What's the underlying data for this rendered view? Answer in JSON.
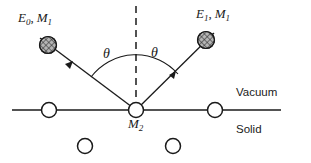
{
  "figure": {
    "kind": "scattering-diagram",
    "colors": {
      "ink": "#1a1a1a",
      "background": "#ffffff",
      "particle_fill": "#8c8c8c"
    }
  },
  "labels": {
    "incident": {
      "energy_symbol": "E",
      "energy_subscript": "0",
      "separator": ",",
      "mass_symbol": "M",
      "mass_subscript": "1",
      "full_text": "E0, M1"
    },
    "scattered": {
      "energy_symbol": "E",
      "energy_subscript": "1",
      "separator": ",",
      "mass_symbol": "M",
      "mass_subscript": "1",
      "full_text": "E1, M1"
    },
    "target": {
      "mass_symbol": "M",
      "mass_subscript": "2",
      "full_text": "M2"
    },
    "angle_left": "θ",
    "angle_right": "θ",
    "region_above": "Vacuum",
    "region_below": "Solid"
  },
  "geometry": {
    "surface_line": {
      "x1": 12,
      "y1": 110,
      "x2": 281,
      "y2": 110
    },
    "normal_line": {
      "x1": 136,
      "y1": 6,
      "x2": 136,
      "y2": 110
    },
    "vertex": {
      "x": 136,
      "y": 110
    },
    "incident_ray": {
      "x1": 40,
      "y1": 38,
      "x2": 136,
      "y2": 110
    },
    "scattered_ray": {
      "x1": 136,
      "y1": 110,
      "x2": 214,
      "y2": 33
    },
    "angle_arc": {
      "radius": 56,
      "start_x": 91,
      "start_y": 77,
      "end_x": 178,
      "end_y": 74
    },
    "incident_particle": {
      "cx": 48,
      "cy": 45,
      "r": 8.5
    },
    "scattered_particle": {
      "cx": 206,
      "cy": 40,
      "r": 8.5
    },
    "surface_atoms": [
      {
        "cx": 49,
        "cy": 110,
        "r": 7.5
      },
      {
        "cx": 136,
        "cy": 110,
        "r": 7.5
      },
      {
        "cx": 215,
        "cy": 110,
        "r": 7.5
      }
    ],
    "subsurface_atoms": [
      {
        "cx": 85,
        "cy": 146,
        "r": 7.5
      },
      {
        "cx": 173,
        "cy": 146,
        "r": 7.5
      }
    ],
    "label_positions": {
      "incident": {
        "x": 18,
        "y": 22
      },
      "scattered": {
        "x": 196,
        "y": 18
      },
      "target": {
        "x": 128,
        "y": 128
      },
      "angle_left": {
        "x": 103,
        "y": 58
      },
      "angle_right": {
        "x": 151,
        "y": 57
      },
      "region_above": {
        "x": 236,
        "y": 96
      },
      "region_below": {
        "x": 236,
        "y": 133
      }
    }
  }
}
